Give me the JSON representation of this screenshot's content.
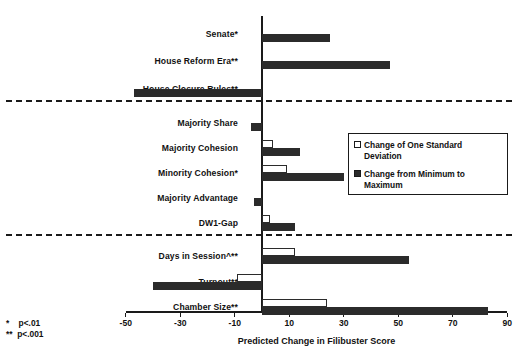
{
  "chart_data": {
    "type": "bar",
    "orientation": "horizontal",
    "title": "",
    "xlabel": "Predicted Change in Filibuster Score",
    "ylabel": "",
    "xlim": [
      -50,
      90
    ],
    "xticks": [
      -50,
      -30,
      -10,
      10,
      30,
      50,
      70,
      90
    ],
    "xticklabels": [
      "-50",
      "-30",
      "-10",
      "10",
      "30",
      "50",
      "70",
      "90"
    ],
    "grid": false,
    "legend_position": "center-right",
    "zero_line": 0,
    "categories": [
      "Senate*",
      "House Reform Era**",
      "House Closure Rules**",
      "Majority Share",
      "Majority Cohesion",
      "Minority Cohesion*",
      "Majority Advantage",
      "DW1-Gap",
      "Days in Session^**",
      "Turnout**",
      "Chamber Size**"
    ],
    "series": [
      {
        "name": "Change of One Standard Deviation",
        "color": "#ffffff",
        "edge_color": "#2b2b2b",
        "values": [
          null,
          null,
          null,
          null,
          4,
          9,
          null,
          3,
          12,
          -9,
          24
        ]
      },
      {
        "name": "Change from Minimum to Maximum",
        "color": "#2b2b2b",
        "edge_color": "#2b2b2b",
        "values": [
          25,
          47,
          -47,
          -4,
          14,
          30,
          -3,
          12,
          54,
          -40,
          83
        ]
      }
    ],
    "group_separators_after": [
      "House Closure Rules**",
      "DW1-Gap"
    ],
    "annotations": [
      "*   p<.01",
      "**  p<.001"
    ]
  },
  "legend": {
    "items": [
      {
        "label": "Change of One Standard\nDeviation",
        "swatch": "hollow"
      },
      {
        "label": "Change from Minimum to\nMaximum",
        "swatch": "filled"
      }
    ]
  },
  "footnotes": {
    "line1": "*    p<.01",
    "line2": "**  p<.001"
  },
  "axis": {
    "title": "Predicted Change in Filibuster Score"
  }
}
